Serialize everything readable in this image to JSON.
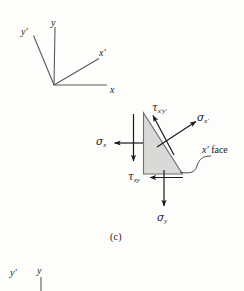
{
  "figure": {
    "caption": "(c)",
    "background_color": "#fdfdfb",
    "line_color": "#4c4c4c",
    "arrow_color": "#1a1a1a",
    "wedge_fill_color": "#d9d9d7",
    "wedge_edge_color": "#6e6e6e"
  },
  "axes_diagram": {
    "name": "rotated-axes",
    "labels": {
      "y_prime": "y′",
      "y": "y",
      "x_prime": "x′",
      "x": "x"
    }
  },
  "stress_element": {
    "name": "triangular-stress-wedge",
    "labels": {
      "tau_xpyp_greek": "τ",
      "tau_xpyp_sub": "x′y′",
      "sigma_xp_greek": "σ",
      "sigma_xp_sub": "x′",
      "sigma_x_greek": "σ",
      "sigma_x_sub": "x",
      "tau_xy_greek": "τ",
      "tau_xy_sub": "xy",
      "sigma_y_greek": "σ",
      "sigma_y_sub": "y",
      "x_prime_face_italic": "x′",
      "x_prime_face_text": " face"
    }
  },
  "next_figure": {
    "y_prime": "y′",
    "y": "y"
  }
}
